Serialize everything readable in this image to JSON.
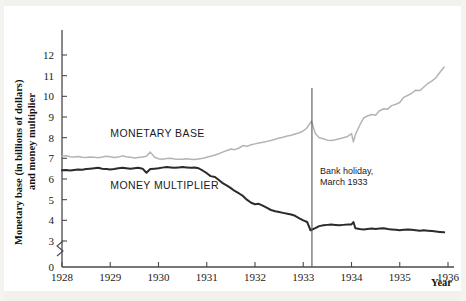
{
  "chart_data": {
    "type": "line",
    "title": "",
    "xlabel": "Year",
    "ylabel": "Monetary base (in billions of dollars) and money multiplier",
    "xlim": [
      1928,
      1936
    ],
    "ylim": [
      3,
      12.5
    ],
    "y_axis_break": true,
    "y_axis_break_note": "axis broken between 0 and 3",
    "grid": false,
    "legend_position": "inline-labels",
    "xticks": [
      "1928",
      "1929",
      "1930",
      "1931",
      "1932",
      "1933",
      "1934",
      "1935",
      "1936"
    ],
    "yticks": [
      "0",
      "3",
      "4",
      "5",
      "6",
      "7",
      "8",
      "9",
      "10",
      "11",
      "12"
    ],
    "annotations": [
      {
        "name": "bank-holiday",
        "text_line1": "Bank holiday,",
        "text_line2": "March 1933",
        "x": 1933.18,
        "marker": "vertical-line"
      }
    ],
    "series": [
      {
        "name": "MONETARY BASE",
        "color": "#b4b4b4",
        "label_x": 1929.0,
        "label_y": 8.05,
        "x": [
          1928.0,
          1928.08,
          1928.17,
          1928.25,
          1928.33,
          1928.42,
          1928.5,
          1928.58,
          1928.67,
          1928.75,
          1928.83,
          1928.92,
          1929.0,
          1929.08,
          1929.17,
          1929.25,
          1929.33,
          1929.42,
          1929.5,
          1929.58,
          1929.67,
          1929.75,
          1929.83,
          1929.92,
          1930.0,
          1930.08,
          1930.17,
          1930.25,
          1930.33,
          1930.42,
          1930.5,
          1930.58,
          1930.67,
          1930.75,
          1930.83,
          1930.92,
          1931.0,
          1931.08,
          1931.17,
          1931.25,
          1931.33,
          1931.42,
          1931.5,
          1931.58,
          1931.67,
          1931.75,
          1931.83,
          1931.92,
          1932.0,
          1932.08,
          1932.17,
          1932.25,
          1932.33,
          1932.42,
          1932.5,
          1932.58,
          1932.67,
          1932.75,
          1932.83,
          1932.92,
          1933.0,
          1933.08,
          1933.17,
          1933.25,
          1933.33,
          1933.42,
          1933.5,
          1933.58,
          1933.67,
          1933.75,
          1933.83,
          1933.92,
          1934.0,
          1934.04,
          1934.08,
          1934.17,
          1934.25,
          1934.33,
          1934.42,
          1934.5,
          1934.58,
          1934.67,
          1934.75,
          1934.83,
          1934.92,
          1935.0,
          1935.08,
          1935.17,
          1935.25,
          1935.33,
          1935.42,
          1935.5,
          1935.58,
          1935.67,
          1935.75,
          1935.83,
          1935.92
        ],
        "y": [
          7.1,
          7.12,
          7.08,
          7.06,
          7.09,
          7.05,
          7.04,
          7.07,
          7.05,
          7.03,
          7.06,
          7.1,
          7.08,
          7.04,
          7.06,
          7.12,
          7.08,
          7.05,
          7.02,
          7.04,
          7.06,
          7.1,
          7.3,
          7.05,
          6.98,
          6.96,
          6.99,
          7.0,
          6.97,
          6.95,
          6.96,
          6.98,
          6.96,
          6.94,
          6.97,
          7.0,
          7.05,
          7.1,
          7.16,
          7.22,
          7.3,
          7.38,
          7.45,
          7.42,
          7.5,
          7.62,
          7.58,
          7.66,
          7.7,
          7.74,
          7.78,
          7.82,
          7.86,
          7.92,
          7.98,
          8.02,
          8.08,
          8.12,
          8.18,
          8.24,
          8.32,
          8.48,
          8.8,
          8.2,
          8.0,
          7.95,
          7.88,
          7.86,
          7.9,
          7.95,
          8.0,
          8.06,
          8.2,
          7.8,
          8.15,
          8.6,
          8.95,
          9.05,
          9.12,
          9.08,
          9.3,
          9.4,
          9.38,
          9.55,
          9.62,
          9.7,
          9.95,
          10.05,
          10.15,
          10.3,
          10.28,
          10.45,
          10.62,
          10.75,
          10.9,
          11.15,
          11.42
        ]
      },
      {
        "name": "MONEY MULTIPLIER",
        "color": "#2b2b2b",
        "label_x": 1929.0,
        "label_y": 5.52,
        "x": [
          1928.0,
          1928.08,
          1928.17,
          1928.25,
          1928.33,
          1928.42,
          1928.5,
          1928.58,
          1928.67,
          1928.75,
          1928.83,
          1928.92,
          1929.0,
          1929.08,
          1929.17,
          1929.25,
          1929.33,
          1929.42,
          1929.5,
          1929.58,
          1929.67,
          1929.75,
          1929.83,
          1929.92,
          1930.0,
          1930.08,
          1930.17,
          1930.25,
          1930.33,
          1930.42,
          1930.5,
          1930.58,
          1930.67,
          1930.75,
          1930.83,
          1930.92,
          1931.0,
          1931.08,
          1931.17,
          1931.25,
          1931.33,
          1931.42,
          1931.5,
          1931.58,
          1931.67,
          1931.75,
          1931.83,
          1931.92,
          1932.0,
          1932.08,
          1932.17,
          1932.25,
          1932.33,
          1932.42,
          1932.5,
          1932.58,
          1932.67,
          1932.75,
          1932.83,
          1932.92,
          1933.0,
          1933.08,
          1933.15,
          1933.25,
          1933.33,
          1933.42,
          1933.5,
          1933.58,
          1933.67,
          1933.75,
          1933.83,
          1933.92,
          1934.0,
          1934.04,
          1934.08,
          1934.17,
          1934.25,
          1934.33,
          1934.42,
          1934.5,
          1934.58,
          1934.67,
          1934.75,
          1934.83,
          1934.92,
          1935.0,
          1935.08,
          1935.17,
          1935.25,
          1935.33,
          1935.42,
          1935.5,
          1935.58,
          1935.67,
          1935.75,
          1935.83,
          1935.92
        ],
        "y": [
          6.42,
          6.43,
          6.41,
          6.44,
          6.46,
          6.45,
          6.48,
          6.5,
          6.52,
          6.54,
          6.5,
          6.48,
          6.46,
          6.48,
          6.52,
          6.54,
          6.52,
          6.5,
          6.52,
          6.54,
          6.5,
          6.3,
          6.48,
          6.5,
          6.52,
          6.55,
          6.58,
          6.56,
          6.54,
          6.56,
          6.58,
          6.56,
          6.54,
          6.56,
          6.52,
          6.4,
          6.28,
          6.14,
          6.1,
          5.95,
          5.8,
          5.68,
          5.56,
          5.42,
          5.3,
          5.18,
          5.0,
          4.85,
          4.78,
          4.8,
          4.7,
          4.6,
          4.5,
          4.44,
          4.4,
          4.36,
          4.32,
          4.28,
          4.22,
          4.1,
          4.0,
          3.92,
          3.52,
          3.62,
          3.72,
          3.76,
          3.78,
          3.8,
          3.78,
          3.76,
          3.78,
          3.8,
          3.8,
          3.92,
          3.62,
          3.58,
          3.56,
          3.58,
          3.6,
          3.58,
          3.6,
          3.62,
          3.58,
          3.56,
          3.54,
          3.52,
          3.54,
          3.56,
          3.54,
          3.52,
          3.5,
          3.52,
          3.5,
          3.48,
          3.46,
          3.44,
          3.42
        ]
      }
    ]
  },
  "axis": {
    "x_title": "Year",
    "y_title_line1": "Monetary base (in billions of dollars)",
    "y_title_line2": "and money multiplier"
  }
}
